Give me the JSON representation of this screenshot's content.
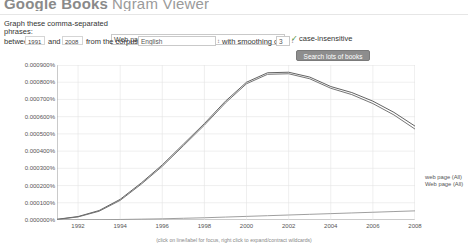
{
  "header": {
    "brand_google_books": "Google Books",
    "brand_ngram": "Ngram Viewer"
  },
  "form": {
    "graph_label": "Graph these comma-separated",
    "phrases_label": "phrases:",
    "query_value": "Web page,web page,webpage",
    "between_label": "between",
    "year_start": "1991",
    "and_label": "and",
    "year_end": "2008",
    "corpus_label": "from the corpus",
    "corpus_value": "English",
    "corpus_caret": "↕",
    "smoothing_label": "with smoothing of",
    "smoothing_value": "3",
    "smoothing_caret": "↕",
    "case_insensitive_tick": "✓",
    "case_insensitive_label": "case-insensitive",
    "search_button": "Search lots of books"
  },
  "chart_caption": "(click on line/label for focus, right click to expand/contract wildcards)",
  "colors": {
    "line_web_page_lower": "#5a5a5a",
    "line_web_page_upper": "#6e6e6e",
    "line_webpage": "#9a9a9a",
    "grid": "#e4e4e4",
    "axis": "#8a8a8a",
    "button_bg": "#8d8d8d",
    "tick_green": "#4a8f3c"
  },
  "chart_data": {
    "type": "line",
    "title": "",
    "xlabel": "",
    "ylabel": "",
    "xlim": [
      1991,
      2008
    ],
    "ylim": [
      0.0,
      0.0009
    ],
    "grid": true,
    "legend_position": "right",
    "x_ticks": [
      "1992",
      "1994",
      "1996",
      "1998",
      "2000",
      "2002",
      "2004",
      "2006",
      "2008"
    ],
    "x_tick_values": [
      1992,
      1994,
      1996,
      1998,
      2000,
      2002,
      2004,
      2006,
      2008
    ],
    "y_ticks": [
      "0.000900%",
      "0.000800%",
      "0.000700%",
      "0.000600%",
      "0.000500%",
      "0.000400%",
      "0.000300%",
      "0.000200%",
      "0.000100%",
      "0.000000%"
    ],
    "y_tick_values": [
      0.0009,
      0.0008,
      0.0007,
      0.0006,
      0.0005,
      0.0004,
      0.0003,
      0.0002,
      0.0001,
      0.0
    ],
    "x": [
      1991,
      1992,
      1993,
      1994,
      1995,
      1996,
      1997,
      1998,
      1999,
      2000,
      2001,
      2002,
      2003,
      2004,
      2005,
      2006,
      2007,
      2008
    ],
    "series": [
      {
        "name": "web page (All)",
        "legend_label": "web page (All)",
        "values": [
          4e-06,
          2e-05,
          5.5e-05,
          0.00012,
          0.000215,
          0.00032,
          0.00044,
          0.00056,
          0.00069,
          0.0008,
          0.000855,
          0.000858,
          0.00083,
          0.000775,
          0.00074,
          0.00069,
          0.000625,
          0.000545
        ]
      },
      {
        "name": "Web page (All)",
        "legend_label": "Web page (All)",
        "values": [
          3e-06,
          1.8e-05,
          5.1e-05,
          0.000114,
          0.000208,
          0.000312,
          0.000431,
          0.000551,
          0.00068,
          0.000791,
          0.000846,
          0.000849,
          0.00082,
          0.000765,
          0.000728,
          0.000676,
          0.00061,
          0.000528
        ]
      },
      {
        "name": "webpage (All)",
        "legend_label": "webpage (All)",
        "values": [
          0.0,
          1e-06,
          2e-06,
          3e-06,
          5e-06,
          7e-06,
          1e-05,
          1.3e-05,
          1.7e-05,
          2.1e-05,
          2.5e-05,
          2.9e-05,
          3.3e-05,
          3.7e-05,
          4.1e-05,
          4.5e-05,
          4.9e-05,
          5.3e-05
        ]
      }
    ]
  }
}
